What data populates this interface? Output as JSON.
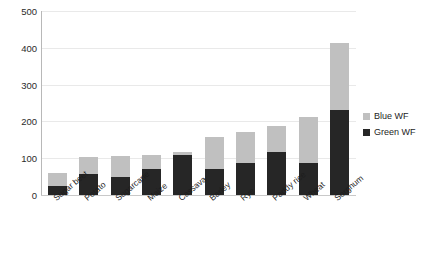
{
  "chart_data": {
    "type": "bar",
    "stacked": true,
    "title": "",
    "xlabel": "",
    "ylabel": "",
    "ylim": [
      0,
      500
    ],
    "yticks": [
      0,
      100,
      200,
      300,
      400,
      500
    ],
    "grid": true,
    "legend_position": "right",
    "categories": [
      "Sugar beet",
      "Potato",
      "Sugarcane",
      "Maize",
      "Cassava",
      "Barley",
      "Rye",
      "Paddy rice",
      "Wheat",
      "Sorghum"
    ],
    "series": [
      {
        "name": "Green WF",
        "color": "#262626",
        "values": [
          25,
          57,
          50,
          70,
          108,
          70,
          88,
          118,
          88,
          231
        ]
      },
      {
        "name": "Blue WF",
        "color": "#c0c0c0",
        "values": [
          35,
          45,
          55,
          40,
          10,
          88,
          84,
          70,
          123,
          182
        ]
      }
    ],
    "totals": [
      60,
      102,
      105,
      110,
      118,
      158,
      172,
      188,
      211,
      413
    ]
  },
  "legend": {
    "items": [
      {
        "label": "Blue WF",
        "color": "#c0c0c0"
      },
      {
        "label": "Green WF",
        "color": "#262626"
      }
    ]
  },
  "axis": {
    "y_tick_labels": [
      "500",
      "400",
      "300",
      "200",
      "100",
      "0"
    ]
  }
}
